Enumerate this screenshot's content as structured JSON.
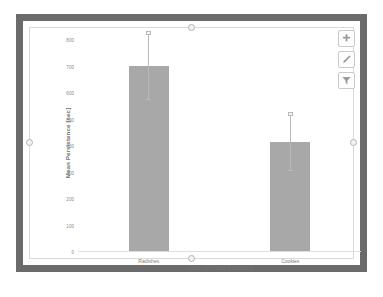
{
  "object": {
    "name": "chart-object",
    "selected": true,
    "frame_color": "#6b6b6b",
    "background": "#ffffff"
  },
  "toolbar": {
    "buttons": [
      {
        "name": "add-button",
        "icon": "plus-icon",
        "label": "Add"
      },
      {
        "name": "edit-button",
        "icon": "pencil-icon",
        "label": "Edit"
      },
      {
        "name": "filter-button",
        "icon": "filter-icon",
        "label": "Filter"
      }
    ]
  },
  "chart_data": {
    "type": "bar",
    "title": "",
    "categories": [
      "Radishes",
      "Cookies"
    ],
    "values": [
      700,
      410
    ],
    "errors_low": [
      575,
      305
    ],
    "errors_high": [
      825,
      520
    ],
    "xlabel": "Type of Food Resisted",
    "ylabel": "Mean Persistence [sec]",
    "ylim": [
      0,
      800
    ],
    "yticks": [
      0,
      100,
      200,
      300,
      400,
      500,
      600,
      700,
      800
    ],
    "ytick_labels": [
      "0",
      "100",
      "200",
      "300",
      "400",
      "500",
      "600",
      "700",
      "800"
    ],
    "grid": false,
    "legend": false,
    "bar_color": "#a8a8a8",
    "error_color": "#b9b9b9"
  }
}
